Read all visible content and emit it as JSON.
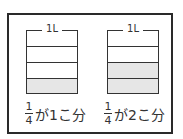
{
  "diagram": {
    "type": "liter-measure-fractions",
    "containers": [
      {
        "capacity_label": "1L",
        "divisions": 4,
        "filled_parts": 1,
        "caption": {
          "fraction_numerator": "1",
          "fraction_denominator": "4",
          "text": "が1こ分"
        }
      },
      {
        "capacity_label": "1L",
        "divisions": 4,
        "filled_parts": 2,
        "caption": {
          "fraction_numerator": "1",
          "fraction_denominator": "4",
          "text": "が2こ分"
        }
      }
    ],
    "colors": {
      "fill": "#e6e6e6",
      "line": "#333333",
      "frame": "#2a2a2a"
    }
  }
}
